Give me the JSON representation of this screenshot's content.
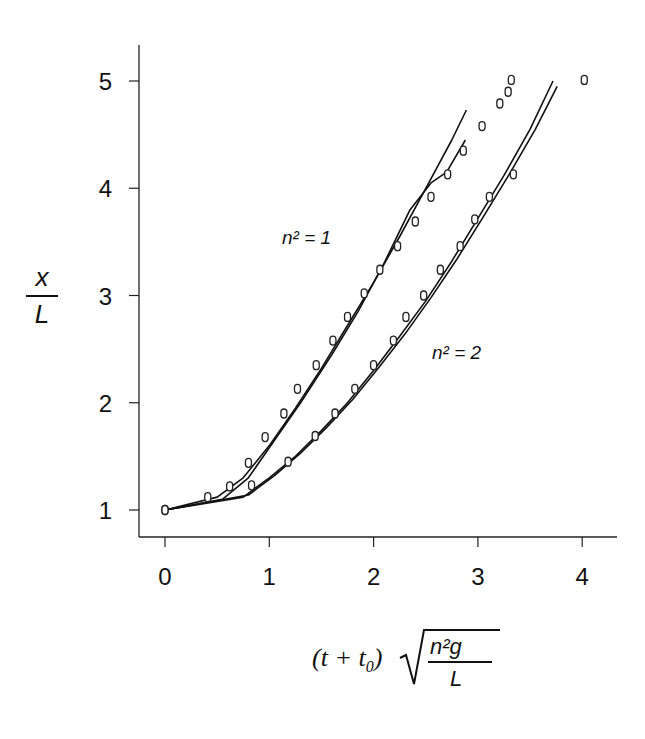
{
  "chart_data": {
    "type": "scatter",
    "title": "",
    "xlabel": "(t + t0) sqrt(n^2 g / L)",
    "ylabel": "x / L",
    "xlim": [
      -0.25,
      4.35
    ],
    "ylim": [
      0.75,
      5.5
    ],
    "xticks": [
      0,
      1,
      2,
      3,
      4
    ],
    "yticks": [
      1,
      2,
      3,
      4,
      5
    ],
    "grid": false,
    "legend": "inline labels",
    "annotations": [
      {
        "text": "n² = 1",
        "x": 1.2,
        "y": 3.6
      },
      {
        "text": "n² = 2",
        "x": 2.6,
        "y": 2.5
      }
    ],
    "series": [
      {
        "name": "n² = 1 (measured)",
        "kind": "points",
        "x": [
          0,
          0.41,
          0.62,
          0.8,
          0.96,
          1.14,
          1.27,
          1.45,
          1.61,
          1.75,
          1.91,
          2.06,
          2.23,
          2.4,
          2.55,
          2.71,
          2.86,
          3.04,
          3.21,
          3.29,
          3.32
        ],
        "y": [
          1.0,
          1.12,
          1.22,
          1.44,
          1.68,
          1.9,
          2.13,
          2.35,
          2.58,
          2.8,
          3.02,
          3.24,
          3.46,
          3.69,
          3.92,
          4.13,
          4.35,
          4.58,
          4.79,
          4.9,
          5.01
        ]
      },
      {
        "name": "n² = 2 (measured)",
        "kind": "points",
        "x": [
          0,
          0.83,
          1.18,
          1.44,
          1.63,
          1.82,
          2.0,
          2.19,
          2.31,
          2.48,
          2.64,
          2.83,
          2.97,
          3.11,
          3.34,
          4.02
        ],
        "y": [
          1.0,
          1.23,
          1.45,
          1.69,
          1.9,
          2.13,
          2.35,
          2.58,
          2.8,
          3.0,
          3.24,
          3.46,
          3.71,
          3.92,
          4.13,
          5.01
        ]
      },
      {
        "name": "n² = 1 (model curve A)",
        "kind": "line",
        "x": [
          0,
          0.5,
          0.75,
          1.0,
          1.25,
          1.5,
          1.75,
          2.0,
          2.25,
          2.5,
          2.75,
          2.89
        ],
        "y": [
          1.0,
          1.12,
          1.3,
          1.6,
          1.95,
          2.32,
          2.72,
          3.12,
          3.55,
          4.0,
          4.45,
          4.73
        ]
      },
      {
        "name": "n² = 1 (model curve B)",
        "kind": "line",
        "x": [
          0,
          0.55,
          0.8,
          1.05,
          1.3,
          1.6,
          1.85,
          2.1,
          2.35,
          2.55,
          2.7,
          2.88
        ],
        "y": [
          1.0,
          1.1,
          1.3,
          1.65,
          2.0,
          2.45,
          2.85,
          3.3,
          3.8,
          4.05,
          4.15,
          4.45
        ]
      },
      {
        "name": "n² = 2 (model curve A)",
        "kind": "line",
        "x": [
          0,
          0.75,
          1.0,
          1.25,
          1.5,
          1.75,
          2.0,
          2.25,
          2.5,
          2.75,
          3.0,
          3.25,
          3.5,
          3.72
        ],
        "y": [
          1.0,
          1.12,
          1.3,
          1.5,
          1.74,
          2.0,
          2.3,
          2.62,
          2.95,
          3.32,
          3.72,
          4.12,
          4.55,
          5.0
        ]
      },
      {
        "name": "n² = 2 (model curve B)",
        "kind": "line",
        "x": [
          0,
          0.8,
          1.05,
          1.3,
          1.55,
          1.8,
          2.05,
          2.3,
          2.55,
          2.8,
          3.05,
          3.3,
          3.55,
          3.76
        ],
        "y": [
          1.0,
          1.14,
          1.32,
          1.53,
          1.77,
          2.03,
          2.33,
          2.64,
          2.98,
          3.34,
          3.73,
          4.13,
          4.55,
          4.95
        ]
      }
    ]
  },
  "labels": {
    "y_num": "x",
    "y_den": "L",
    "x_prefix": "(t + t",
    "x_sub": "0",
    "x_close": ")",
    "x_rad_num": "n²g",
    "x_rad_den": "L",
    "curve1": "n² = 1",
    "curve2": "n² = 2"
  }
}
